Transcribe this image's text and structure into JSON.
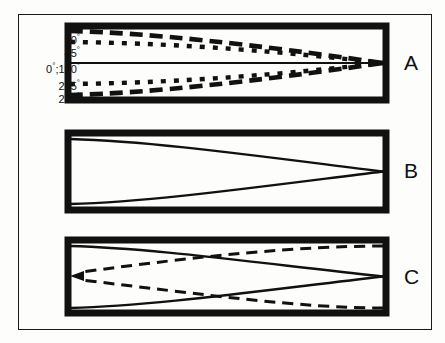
{
  "figure": {
    "type": "scientific-diagram",
    "background_color": "#fdfdfb",
    "line_color": "#111111",
    "panels": [
      {
        "letter": "A",
        "box": {
          "x": 68,
          "y": 26,
          "width": 318,
          "height": 74
        },
        "rays": [
          {
            "label": "90°",
            "style": "long-dash",
            "start_fraction": 0.055,
            "description": "upper long-dash ray from top wall converging to right wall"
          },
          {
            "label": "45°",
            "style": "dotted",
            "start_fraction": 0.22,
            "description": "upper dotted ray converging to right wall"
          },
          {
            "label": "0°;180°",
            "style": "solid",
            "start_fraction": 0.5,
            "description": "straight axial solid line along centre"
          },
          {
            "label": "225°",
            "style": "dotted",
            "start_fraction": 0.78,
            "description": "lower dotted ray converging to right wall"
          },
          {
            "label": "270°",
            "style": "long-dash",
            "start_fraction": 0.945,
            "description": "lower long-dash ray from bottom wall converging to right wall"
          }
        ]
      },
      {
        "letter": "B",
        "box": {
          "x": 68,
          "y": 133,
          "width": 318,
          "height": 77
        },
        "rays": [
          {
            "label": "",
            "style": "solid",
            "start_fraction": 0.06,
            "description": "upper solid curve converging to right wall"
          },
          {
            "label": "",
            "style": "solid",
            "start_fraction": 0.94,
            "description": "lower solid curve converging to right wall"
          }
        ]
      },
      {
        "letter": "C",
        "box": {
          "x": 68,
          "y": 240,
          "width": 318,
          "height": 73
        },
        "rays": [
          {
            "label": "",
            "style": "solid",
            "start_fraction": 0.06,
            "description": "upper solid curve converging to right wall"
          },
          {
            "label": "",
            "style": "solid",
            "start_fraction": 0.94,
            "description": "lower solid curve converging to right wall"
          },
          {
            "label": "",
            "style": "dashed",
            "description": "upper dashed reverse ray running from right wall back to left arrowhead"
          },
          {
            "label": "",
            "style": "dashed",
            "description": "lower dashed reverse ray running from right wall back to left arrowhead"
          }
        ],
        "arrowhead": {
          "x": 78,
          "y": 276,
          "direction": "left"
        }
      }
    ],
    "angle_labels": [
      {
        "text": "90",
        "degree": "°",
        "y": 32
      },
      {
        "text": "45",
        "degree": "°",
        "y": 45
      },
      {
        "text": "0",
        "degree": "°",
        "suffix": ";180",
        "degree2": "°",
        "y": 61
      },
      {
        "text": "225",
        "degree": "°",
        "y": 78
      },
      {
        "text": "270",
        "degree": "°",
        "y": 91
      }
    ],
    "panel_letters": [
      {
        "letter": "A",
        "x": 404,
        "y": 53
      },
      {
        "letter": "B",
        "x": 404,
        "y": 161
      },
      {
        "letter": "C",
        "x": 404,
        "y": 267
      }
    ]
  }
}
